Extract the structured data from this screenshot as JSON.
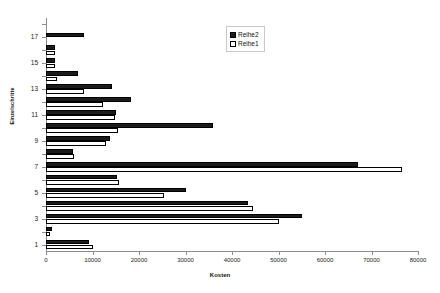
{
  "chart_data": {
    "type": "bar",
    "orientation": "horizontal",
    "title": "",
    "xlabel": "Kosten",
    "ylabel": "Einzelschritte",
    "xlim": [
      0,
      80000
    ],
    "xticks": [
      0,
      10000,
      20000,
      30000,
      40000,
      50000,
      60000,
      70000,
      80000
    ],
    "xticklabels": [
      "0",
      "10000",
      "20000",
      "30000",
      "40000",
      "50000",
      "60000",
      "70000",
      "80000"
    ],
    "yticks": [
      1,
      3,
      5,
      7,
      9,
      11,
      13,
      15,
      17
    ],
    "yticklabels": [
      "1",
      "3",
      "5",
      "7",
      "9",
      "11",
      "13",
      "15",
      "17"
    ],
    "categories": [
      1,
      2,
      3,
      4,
      5,
      6,
      7,
      8,
      9,
      10,
      11,
      12,
      13,
      14,
      15,
      16,
      17,
      18
    ],
    "grid": false,
    "legend_position": "top-center",
    "series": [
      {
        "name": "Reihe2",
        "color": "#1b1b1b",
        "values": [
          9200,
          1200,
          55000,
          43500,
          30000,
          15300,
          67000,
          5800,
          13800,
          36000,
          15000,
          18200,
          14200,
          6800,
          2000,
          2000,
          8100,
          0
        ]
      },
      {
        "name": "Reihe1",
        "color": "#ffffff",
        "values": [
          10200,
          900,
          50000,
          44500,
          25300,
          15600,
          76500,
          6000,
          13000,
          15500,
          14900,
          12300,
          8200,
          2300,
          2000,
          2000,
          0,
          0
        ]
      }
    ]
  },
  "legend": {
    "items": [
      {
        "label": "Reihe2"
      },
      {
        "label": "Reihe1"
      }
    ]
  },
  "axis": {
    "x_title": "Kosten",
    "y_title": "Einzelschritte"
  }
}
